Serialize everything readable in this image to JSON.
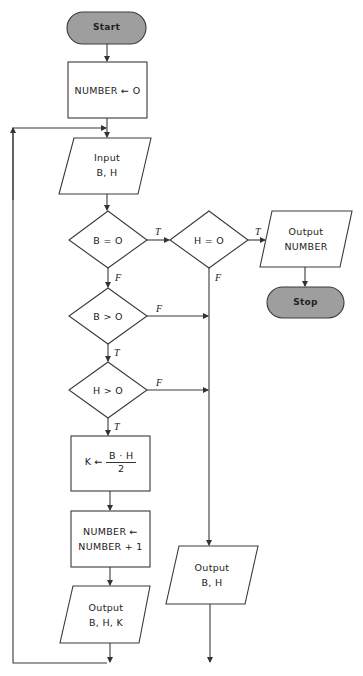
{
  "diagram": {
    "type": "flowchart",
    "colors": {
      "stroke": "#3a3a3a",
      "terminal_fill": "#9e9e9e",
      "background": "#ffffff"
    },
    "nodes": {
      "start": {
        "shape": "terminal",
        "label": "Start"
      },
      "init": {
        "shape": "process",
        "label": "NUMBER ← O"
      },
      "input": {
        "shape": "io",
        "line1": "Input",
        "line2": "B, H"
      },
      "b_eq_0": {
        "shape": "decision",
        "label": "B = O"
      },
      "h_eq_0": {
        "shape": "decision",
        "label": "H = O"
      },
      "output_number": {
        "shape": "io",
        "line1": "Output",
        "line2": "NUMBER"
      },
      "stop": {
        "shape": "terminal",
        "label": "Stop"
      },
      "b_gt_0": {
        "shape": "decision",
        "label": "B > O"
      },
      "h_gt_0": {
        "shape": "decision",
        "label": "H > O"
      },
      "compute_k": {
        "shape": "process",
        "lhs": "K ←",
        "numerator": "B · H",
        "denominator": "2"
      },
      "increment": {
        "shape": "process",
        "line1": "NUMBER ←",
        "line2": "NUMBER + 1"
      },
      "output_bhk": {
        "shape": "io",
        "line1": "Output",
        "line2": "B, H, K"
      },
      "output_bh": {
        "shape": "io",
        "line1": "Output",
        "line2": "B, H"
      }
    },
    "edge_labels": {
      "b_eq_0_true": "T",
      "b_eq_0_false": "F",
      "h_eq_0_true": "T",
      "h_eq_0_false": "F",
      "b_gt_0_true": "T",
      "b_gt_0_false": "F",
      "h_gt_0_true": "T",
      "h_gt_0_false": "F"
    },
    "edges": [
      [
        "start",
        "init"
      ],
      [
        "init",
        "input"
      ],
      [
        "input",
        "b_eq_0"
      ],
      [
        "b_eq_0",
        "h_eq_0",
        "T"
      ],
      [
        "b_eq_0",
        "b_gt_0",
        "F"
      ],
      [
        "h_eq_0",
        "output_number",
        "T"
      ],
      [
        "h_eq_0",
        "output_bh",
        "F"
      ],
      [
        "output_number",
        "stop"
      ],
      [
        "b_gt_0",
        "h_gt_0",
        "T"
      ],
      [
        "b_gt_0",
        "output_bh",
        "F"
      ],
      [
        "h_gt_0",
        "compute_k",
        "T"
      ],
      [
        "h_gt_0",
        "output_bh",
        "F"
      ],
      [
        "compute_k",
        "increment"
      ],
      [
        "increment",
        "output_bhk"
      ],
      [
        "output_bhk",
        "input"
      ],
      [
        "output_bh",
        "input"
      ]
    ]
  }
}
